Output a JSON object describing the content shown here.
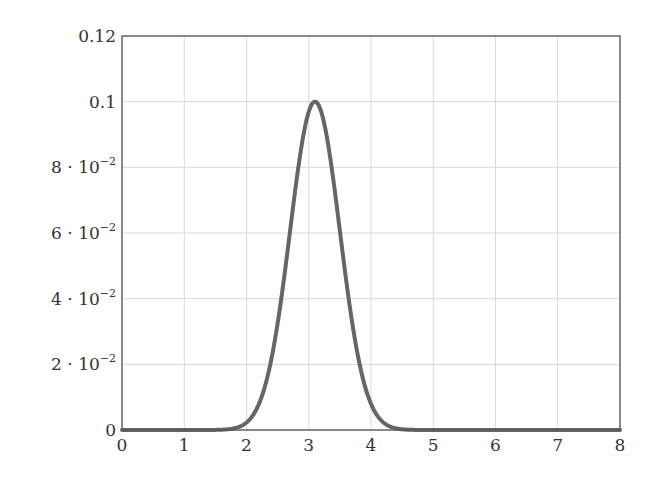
{
  "chart_data": {
    "type": "line",
    "title": "",
    "xlabel": "",
    "ylabel": "",
    "xlim": [
      0,
      8
    ],
    "ylim": [
      0,
      0.12
    ],
    "grid": true,
    "legend": null,
    "x_ticks": [
      0,
      1,
      2,
      3,
      4,
      5,
      6,
      7,
      8
    ],
    "x_tick_labels": [
      "0",
      "1",
      "2",
      "3",
      "4",
      "5",
      "6",
      "7",
      "8"
    ],
    "y_ticks": [
      0,
      0.02,
      0.04,
      0.06,
      0.08,
      0.1,
      0.12
    ],
    "y_tick_labels": [
      {
        "mantissa": "0",
        "exponent": ""
      },
      {
        "mantissa": "2 · 10",
        "exponent": "−2"
      },
      {
        "mantissa": "4 · 10",
        "exponent": "−2"
      },
      {
        "mantissa": "6 · 10",
        "exponent": "−2"
      },
      {
        "mantissa": "8 · 10",
        "exponent": "−2"
      },
      {
        "mantissa": "0.1",
        "exponent": ""
      },
      {
        "mantissa": "0.12",
        "exponent": ""
      }
    ],
    "series": [
      {
        "name": "gaussian",
        "color": "#666666",
        "line_width": 4,
        "model": {
          "kind": "gaussian",
          "mean": 3.1,
          "sigma": 0.4,
          "peak": 0.1
        },
        "x": [
          0,
          1,
          1.5,
          1.8,
          2.0,
          2.2,
          2.4,
          2.6,
          2.8,
          3.0,
          3.1,
          3.2,
          3.4,
          3.6,
          3.8,
          4.0,
          4.2,
          4.4,
          4.7,
          5,
          6,
          7,
          8
        ],
        "y": [
          0,
          0,
          0.0,
          0.0005,
          0.0023,
          0.008,
          0.0216,
          0.0458,
          0.0755,
          0.0969,
          0.1,
          0.0969,
          0.0755,
          0.0458,
          0.0216,
          0.008,
          0.0023,
          0.0005,
          0.0,
          0,
          0,
          0,
          0
        ]
      }
    ]
  },
  "colors": {
    "axis": "#555555",
    "grid": "#d9d9d9",
    "curve": "#666666"
  }
}
